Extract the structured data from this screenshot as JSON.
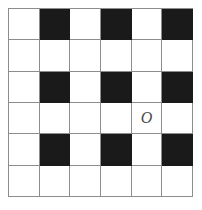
{
  "figure": {
    "rows": 6,
    "columns": 6,
    "colors": {
      "filled": "#1a1a1a",
      "empty": "#ffffff",
      "gridline": "#8d8d8d",
      "mark": "#4a4a4a"
    },
    "legend": {
      "filled_label": "black square",
      "empty_label": "white square"
    }
  },
  "grid": {
    "cells": [
      [
        {
          "fill": "empty",
          "mark": ""
        },
        {
          "fill": "filled",
          "mark": ""
        },
        {
          "fill": "empty",
          "mark": ""
        },
        {
          "fill": "filled",
          "mark": ""
        },
        {
          "fill": "empty",
          "mark": ""
        },
        {
          "fill": "filled",
          "mark": ""
        }
      ],
      [
        {
          "fill": "empty",
          "mark": ""
        },
        {
          "fill": "empty",
          "mark": ""
        },
        {
          "fill": "empty",
          "mark": ""
        },
        {
          "fill": "empty",
          "mark": ""
        },
        {
          "fill": "empty",
          "mark": ""
        },
        {
          "fill": "empty",
          "mark": ""
        }
      ],
      [
        {
          "fill": "empty",
          "mark": ""
        },
        {
          "fill": "filled",
          "mark": ""
        },
        {
          "fill": "empty",
          "mark": ""
        },
        {
          "fill": "filled",
          "mark": ""
        },
        {
          "fill": "empty",
          "mark": ""
        },
        {
          "fill": "filled",
          "mark": ""
        }
      ],
      [
        {
          "fill": "empty",
          "mark": ""
        },
        {
          "fill": "empty",
          "mark": ""
        },
        {
          "fill": "empty",
          "mark": ""
        },
        {
          "fill": "empty",
          "mark": ""
        },
        {
          "fill": "empty",
          "mark": "O"
        },
        {
          "fill": "empty",
          "mark": ""
        }
      ],
      [
        {
          "fill": "empty",
          "mark": ""
        },
        {
          "fill": "filled",
          "mark": ""
        },
        {
          "fill": "empty",
          "mark": ""
        },
        {
          "fill": "filled",
          "mark": ""
        },
        {
          "fill": "empty",
          "mark": ""
        },
        {
          "fill": "filled",
          "mark": ""
        }
      ],
      [
        {
          "fill": "empty",
          "mark": ""
        },
        {
          "fill": "empty",
          "mark": ""
        },
        {
          "fill": "empty",
          "mark": ""
        },
        {
          "fill": "empty",
          "mark": ""
        },
        {
          "fill": "empty",
          "mark": ""
        },
        {
          "fill": "empty",
          "mark": ""
        }
      ]
    ]
  }
}
